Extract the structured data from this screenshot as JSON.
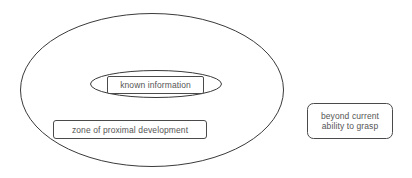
{
  "diagram": {
    "type": "nested-ellipse-venn",
    "background_color": "#ffffff",
    "stroke_color": "#3a3a3a",
    "text_color": "#555555",
    "shapes": {
      "outer_ellipse": {
        "name": "zone-of-proximal-development-ellipse",
        "cx": 152,
        "cy": 90,
        "rx": 132,
        "ry": 77
      },
      "inner_ellipse": {
        "name": "known-information-ellipse",
        "cx": 156,
        "cy": 84,
        "rx": 66,
        "ry": 14
      }
    },
    "labels": {
      "known_information": "known information",
      "zone_of_proximal_development": "zone of proximal development",
      "beyond_current_line1": "beyond current",
      "beyond_current_line2": "ability to grasp"
    }
  }
}
